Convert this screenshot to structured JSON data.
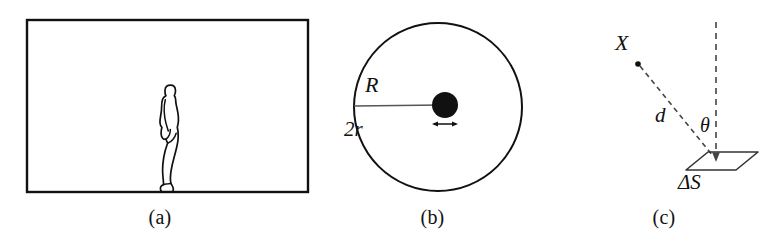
{
  "figure": {
    "background_color": "#ffffff",
    "stroke_color": "#111111",
    "width": 783,
    "height": 250,
    "panel_count": 3
  },
  "panels": [
    {
      "id": "a",
      "caption": "(a)",
      "description": "rectangular frame containing a standing human silhouette in side profile",
      "elements": {
        "frame": {
          "shape": "rectangle",
          "x": 27,
          "y": 20,
          "width": 281,
          "height": 172,
          "stroke_width": 2.4,
          "fill": "none"
        },
        "human_figure": {
          "shape": "silhouette-outline",
          "facing": "left",
          "x": 160,
          "y": 85,
          "width": 22,
          "height": 107,
          "fill": "none",
          "stroke_width": 1.6
        }
      }
    },
    {
      "id": "b",
      "caption": "(b)",
      "description": "large circle of radius R with a small filled disc of diameter 2r at a point inside",
      "labels": {
        "radius": "R",
        "diameter": "2r"
      },
      "elements": {
        "outer_circle": {
          "shape": "circle",
          "cx": 118,
          "cy": 107,
          "r": 84,
          "stroke_width": 2.0,
          "fill": "none"
        },
        "radius_line": {
          "shape": "line",
          "x1": 34,
          "y1": 106,
          "x2": 118,
          "y2": 106,
          "stroke_width": 1.6
        },
        "inner_disc": {
          "shape": "filled-circle",
          "cx": 125,
          "cy": 105,
          "r": 13,
          "fill": "#111111"
        },
        "diameter_arrow": {
          "shape": "double-headed-arrow",
          "x1": 112,
          "x2": 138,
          "y": 124,
          "stroke_width": 1.4
        }
      }
    },
    {
      "id": "c",
      "caption": "(c)",
      "description": "source point X at distance d from a surface element Delta S, with angle theta between the line of sight and the surface normal",
      "labels": {
        "source": "X",
        "distance": "d",
        "angle": "θ",
        "area_element": "ΔS"
      },
      "elements": {
        "source_dot": {
          "shape": "dot",
          "cx": 93,
          "cy": 64,
          "r": 2.6,
          "fill": "#111111"
        },
        "sight_line": {
          "shape": "dashed-line",
          "x1": 93,
          "y1": 64,
          "x2": 168,
          "y2": 156,
          "dash": "5,4",
          "stroke_width": 1.5
        },
        "normal_line": {
          "shape": "dashed-line-with-arrow",
          "x1": 171,
          "y1": 22,
          "x2": 171,
          "y2": 160,
          "dash": "6,5",
          "stroke_width": 1.5,
          "arrow_at": "bottom"
        },
        "surface_patch": {
          "shape": "parallelogram",
          "points": "145,170 165,152 212,152 192,170",
          "stroke_width": 1.5,
          "fill": "none"
        }
      }
    }
  ]
}
